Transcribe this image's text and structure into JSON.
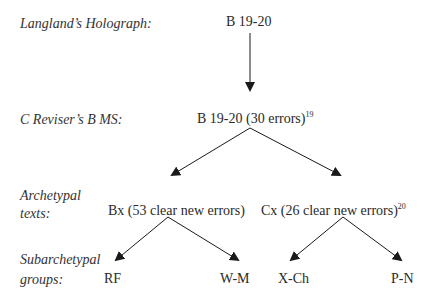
{
  "levels": {
    "holograph": {
      "label": "Langland’s Holograph:"
    },
    "reviser": {
      "label": "C Reviser’s B MS:"
    },
    "archetypal": {
      "label_line1": "Archetypal",
      "label_line2": "texts:"
    },
    "subarchetypal": {
      "label_line1": "Subarchetypal",
      "label_line2": "groups:"
    }
  },
  "nodes": {
    "holograph": {
      "text": "B 19-20"
    },
    "reviser": {
      "text": "B 19-20 (30 errors)",
      "footnote": "19"
    },
    "bx": {
      "text": "Bx (53 clear new errors)"
    },
    "cx": {
      "text": "Cx (26 clear new errors)",
      "footnote": "20"
    },
    "rf": {
      "text": "RF"
    },
    "wm": {
      "text": "W-M"
    },
    "xch": {
      "text": "X-Ch"
    },
    "pn": {
      "text": "P-N"
    }
  },
  "edges": [
    {
      "from": "holograph",
      "to": "reviser"
    },
    {
      "from": "reviser",
      "to": "bx"
    },
    {
      "from": "reviser",
      "to": "cx"
    },
    {
      "from": "bx",
      "to": "rf"
    },
    {
      "from": "bx",
      "to": "wm"
    },
    {
      "from": "cx",
      "to": "xch"
    },
    {
      "from": "cx",
      "to": "pn"
    }
  ],
  "colors": {
    "ink": "#2a2a2a",
    "label": "#333333",
    "background": "#ffffff"
  }
}
